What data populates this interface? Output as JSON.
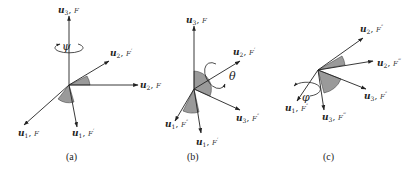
{
  "figure": {
    "panels": [
      {
        "id": "a",
        "caption": "(a)",
        "rotation_symbol": "ψ",
        "rotation_axis": "u3",
        "axes": [
          {
            "vec": "u",
            "sub": "3",
            "frame": "F",
            "prime": ""
          },
          {
            "vec": "u",
            "sub": "2",
            "frame": "F",
            "prime": "′"
          },
          {
            "vec": "u",
            "sub": "2",
            "frame": "F",
            "prime": ""
          },
          {
            "vec": "u",
            "sub": "1",
            "frame": "F",
            "prime": ""
          },
          {
            "vec": "u",
            "sub": "1",
            "frame": "F",
            "prime": "′"
          }
        ]
      },
      {
        "id": "b",
        "caption": "(b)",
        "rotation_symbol": "θ",
        "rotation_axis": "u2",
        "axes": [
          {
            "vec": "u",
            "sub": "3",
            "frame": "F",
            "prime": ""
          },
          {
            "vec": "u",
            "sub": "2",
            "frame": "F",
            "prime": "′"
          },
          {
            "vec": "u",
            "sub": "3",
            "frame": "F",
            "prime": "″"
          },
          {
            "vec": "u",
            "sub": "1",
            "frame": "F",
            "prime": "″"
          },
          {
            "vec": "u",
            "sub": "1",
            "frame": "F",
            "prime": "′"
          }
        ]
      },
      {
        "id": "c",
        "caption": "(c)",
        "rotation_symbol": "φ",
        "rotation_axis": "u1",
        "axes": [
          {
            "vec": "u",
            "sub": "2",
            "frame": "F",
            "prime": "″"
          },
          {
            "vec": "u",
            "sub": "2",
            "frame": "F",
            "prime": "‴"
          },
          {
            "vec": "u",
            "sub": "3",
            "frame": "F",
            "prime": "″"
          },
          {
            "vec": "u",
            "sub": "1",
            "frame": "F",
            "prime": "″"
          },
          {
            "vec": "u",
            "sub": "3",
            "frame": "F",
            "prime": "‴"
          }
        ]
      }
    ]
  }
}
